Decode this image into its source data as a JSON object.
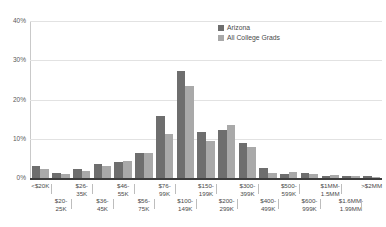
{
  "chart_data": {
    "type": "bar",
    "title": "",
    "xlabel": "",
    "ylabel": "",
    "ylim": [
      0,
      40
    ],
    "yticks": [
      "0%",
      "10%",
      "20%",
      "30%",
      "40%"
    ],
    "ytick_values": [
      0,
      10,
      20,
      30,
      40
    ],
    "grid": true,
    "legend_position": "top-right",
    "categories": [
      "<$20K",
      "$20-25K",
      "$26-35K",
      "$36-45K",
      "$46-55K",
      "$56-75K",
      "$76-99K",
      "$100-149K",
      "$150-199K",
      "$200-299K",
      "$300-399K",
      "$400-499K",
      "$500-599K",
      "$600-999K",
      "$1MM-1.5MM",
      "$1.6MM-1.99MM",
      ">$2MM"
    ],
    "series": [
      {
        "name": "Arizona",
        "color": "#6e6e6e",
        "values": [
          3.0,
          1.2,
          2.2,
          3.6,
          4.0,
          6.3,
          15.7,
          27.2,
          11.7,
          12.3,
          9.0,
          2.6,
          1.0,
          1.2,
          0.6,
          0.5,
          0.4
        ]
      },
      {
        "name": "All College Grads",
        "color": "#a9a9a9",
        "values": [
          2.4,
          1.0,
          1.9,
          3.0,
          4.4,
          6.4,
          11.2,
          23.5,
          9.5,
          13.6,
          7.8,
          1.3,
          1.5,
          0.9,
          0.8,
          0.4,
          0.3
        ]
      }
    ]
  },
  "legend": {
    "items": [
      {
        "label": "Arizona"
      },
      {
        "label": "All College Grads"
      }
    ]
  },
  "xaxis": {
    "row0": [
      "<$20K",
      "$26-\n35K",
      "$46-\n55K",
      "$76-\n99K",
      "$150-\n199K",
      "$300-\n399K",
      "$500-\n599K",
      "$1MM-\n1.5MM",
      ">$2MM"
    ],
    "row1": [
      "$20-\n25K",
      "$36-\n45K",
      "$56-\n75K",
      "$100-\n149K",
      "$200-\n299K",
      "$400-\n499K",
      "$600-\n999K",
      "$1.6MM-\n1.99MM"
    ]
  }
}
